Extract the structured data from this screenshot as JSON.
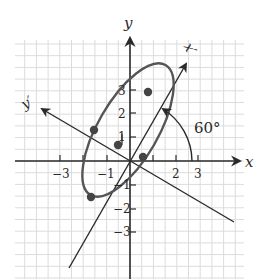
{
  "figure": {
    "axes": {
      "x_label": "x",
      "y_label": "y",
      "x_prime_label": "x′",
      "y_prime_label": "y′",
      "x_tick_labels": [
        "−3",
        "−1",
        "2",
        "3"
      ],
      "y_tick_labels": [
        "3",
        "2",
        "1",
        "−1",
        "−2",
        "−3"
      ]
    },
    "angle_label": "60°",
    "rotation_angle_deg": 60,
    "points": [
      {
        "x": 1.0,
        "y": 2.8
      },
      {
        "x": -1.45,
        "y": 1.3
      },
      {
        "x": -0.5,
        "y": 0.7
      },
      {
        "x": 0.5,
        "y": 0.2
      },
      {
        "x": -1.6,
        "y": -1.55
      }
    ],
    "colors": {
      "axis": "#2a2a2a",
      "ellipse": "#555555",
      "grid": "#d9d9d9",
      "point": "#444444"
    }
  }
}
